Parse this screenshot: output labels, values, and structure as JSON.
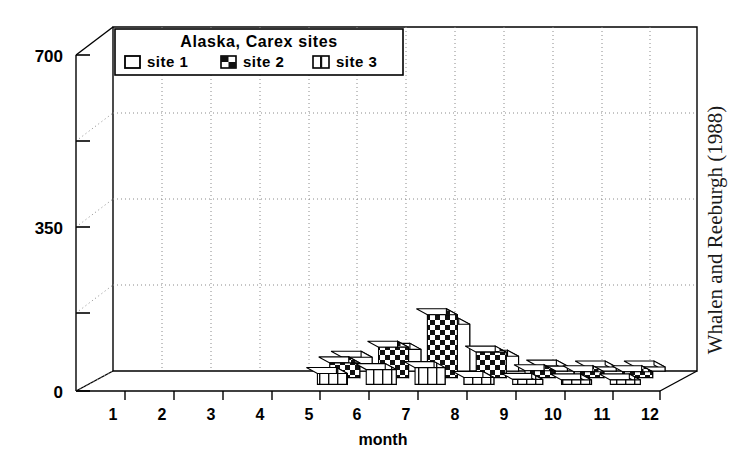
{
  "figure": {
    "credit": "Whalen and Reeburgh (1988)",
    "background_color": "#ffffff",
    "line_color": "#000000",
    "grid_color": "#8a8a8a"
  },
  "legend": {
    "title": "Alaska, Carex sites",
    "items": [
      {
        "label": "site 1",
        "swatch": "blank-swatch",
        "pattern": "blank"
      },
      {
        "label": "site 2",
        "swatch": "checker-swatch",
        "pattern": "checker"
      },
      {
        "label": "site 3",
        "swatch": "vertical-stripe-swatch",
        "pattern": "vstripe"
      }
    ]
  },
  "chart_data": {
    "type": "bar",
    "title": "Alaska, Carex sites",
    "xlabel": "month",
    "ylabel": "",
    "categories": [
      "1",
      "2",
      "3",
      "4",
      "5",
      "6",
      "7",
      "8",
      "9",
      "10",
      "11",
      "12"
    ],
    "yticks": [
      "0",
      "350",
      "700"
    ],
    "ytick_values": [
      0,
      350,
      700
    ],
    "ylim": [
      0,
      700
    ],
    "gridline_values": [
      175,
      350,
      525,
      700
    ],
    "grid": true,
    "legend_position": "top-center",
    "projection": "3d-depth-series",
    "series": [
      {
        "name": "site 1",
        "pattern": "blank",
        "values": [
          0,
          0,
          0,
          0,
          0,
          28,
          44,
          95,
          30,
          10,
          8,
          8
        ]
      },
      {
        "name": "site 2",
        "pattern": "checker",
        "values": [
          0,
          0,
          0,
          0,
          0,
          30,
          62,
          128,
          52,
          14,
          12,
          12
        ]
      },
      {
        "name": "site 3",
        "pattern": "vstripe",
        "values": [
          0,
          0,
          0,
          0,
          0,
          22,
          30,
          34,
          14,
          10,
          9,
          9
        ]
      }
    ]
  }
}
